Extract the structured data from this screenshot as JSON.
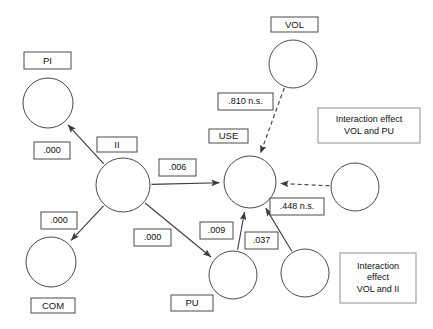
{
  "diagram": {
    "type": "path-model",
    "constructs": [
      {
        "id": "pi",
        "label": "PI",
        "cx": 48,
        "cy": 103,
        "r": 25,
        "box": {
          "x": 24,
          "y": 52,
          "w": 47,
          "h": 17
        },
        "box_position": "above"
      },
      {
        "id": "ii",
        "label": "II",
        "cx": 123,
        "cy": 185,
        "r": 27,
        "box": {
          "x": 97,
          "y": 137,
          "w": 40,
          "h": 15
        },
        "box_position": "above"
      },
      {
        "id": "use",
        "label": "USE",
        "cx": 250,
        "cy": 182,
        "r": 26,
        "box": {
          "x": 209,
          "y": 129,
          "w": 39,
          "h": 14
        },
        "box_position": "above"
      },
      {
        "id": "vol",
        "label": "VOL",
        "cx": 293,
        "cy": 64,
        "r": 24,
        "box": {
          "x": 271,
          "y": 17,
          "w": 47,
          "h": 15
        },
        "box_position": "above"
      },
      {
        "id": "com",
        "label": "COM",
        "cx": 51,
        "cy": 262,
        "r": 25,
        "box": {
          "x": 31,
          "y": 298,
          "w": 44,
          "h": 15
        },
        "box_position": "below"
      },
      {
        "id": "pu",
        "label": "PU",
        "cx": 233,
        "cy": 275,
        "r": 24,
        "box": {
          "x": 171,
          "y": 295,
          "w": 42,
          "h": 16
        },
        "box_position": "below-left"
      },
      {
        "id": "int_vol_pu",
        "label": "",
        "cx": 355,
        "cy": 187,
        "r": 24,
        "box": null,
        "box_position": "none"
      },
      {
        "id": "int_vol_ii",
        "label": "",
        "cx": 305,
        "cy": 273,
        "r": 24,
        "box": null,
        "box_position": "none"
      }
    ],
    "notes": [
      {
        "id": "note_vol_pu",
        "lines": [
          "Interaction effect",
          "VOL and PU"
        ],
        "x": 318,
        "y": 108,
        "w": 102,
        "h": 35
      },
      {
        "id": "note_vol_ii",
        "lines": [
          "Interaction",
          "effect",
          "VOL and II"
        ],
        "x": 340,
        "y": 253,
        "w": 76,
        "h": 50
      }
    ],
    "paths": [
      {
        "id": "ii_to_pi",
        "from": "ii",
        "to": "pi",
        "style": "solid",
        "coefficient": ".000",
        "coef_box": {
          "x": 34,
          "y": 142,
          "w": 36,
          "h": 17
        }
      },
      {
        "id": "ii_to_com",
        "from": "ii",
        "to": "com",
        "style": "solid",
        "coefficient": ".000",
        "coef_box": {
          "x": 41,
          "y": 212,
          "w": 36,
          "h": 17
        }
      },
      {
        "id": "ii_to_use",
        "from": "ii",
        "to": "use",
        "style": "solid",
        "coefficient": ".006",
        "coef_box": {
          "x": 159,
          "y": 159,
          "w": 37,
          "h": 17
        }
      },
      {
        "id": "ii_to_pu",
        "from": "ii",
        "to": "pu",
        "style": "solid",
        "coefficient": ".000",
        "coef_box": {
          "x": 134,
          "y": 229,
          "w": 37,
          "h": 17
        }
      },
      {
        "id": "pu_to_use",
        "from": "pu",
        "to": "use",
        "style": "solid",
        "coefficient": ".009",
        "coef_box": {
          "x": 200,
          "y": 222,
          "w": 33,
          "h": 17
        }
      },
      {
        "id": "intvolii_to_use",
        "from": "int_vol_ii",
        "to": "use",
        "style": "solid",
        "coefficient": ".037",
        "coef_box": {
          "x": 245,
          "y": 232,
          "w": 33,
          "h": 17
        }
      },
      {
        "id": "vol_to_use",
        "from": "vol",
        "to": "use",
        "style": "dashed",
        "coefficient": ".810 n.s.",
        "coef_box": {
          "x": 218,
          "y": 93,
          "w": 55,
          "h": 17
        }
      },
      {
        "id": "intvolpu_to_use",
        "from": "int_vol_pu",
        "to": "use",
        "style": "dashed",
        "coefficient": ".448 n.s.",
        "coef_box": {
          "x": 270,
          "y": 198,
          "w": 54,
          "h": 17
        }
      }
    ]
  }
}
